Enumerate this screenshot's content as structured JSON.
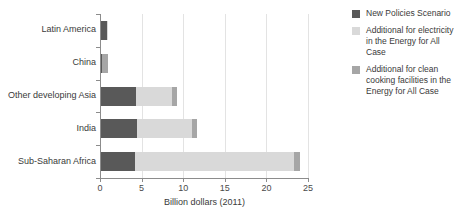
{
  "chart_data": {
    "type": "bar",
    "orientation": "horizontal",
    "stacked": true,
    "title": "",
    "subtitle": "",
    "xlabel": "Billion dollars (2011)",
    "ylabel": "",
    "xlim": [
      0,
      25
    ],
    "xticks": [
      0,
      5,
      10,
      15,
      20,
      25
    ],
    "xticklabels": [
      "0",
      "5",
      "10",
      "15",
      "20",
      "25"
    ],
    "grid": true,
    "grid_axis": "x",
    "legend_position": "right",
    "categories": [
      "Latin America",
      "China",
      "Other developing Asia",
      "India",
      "Sub-Saharan Africa"
    ],
    "series": [
      {
        "name": "New Policies Scenario",
        "color": "#595959",
        "values": [
          0.8,
          0.3,
          4.3,
          4.4,
          4.2
        ]
      },
      {
        "name": "Additional for electricity in the Energy for All Case",
        "color": "#d9d9d9",
        "values": [
          0.05,
          0.0,
          4.4,
          6.6,
          19.1
        ]
      },
      {
        "name": "Additional for clean cooking facilities in the Energy for All Case",
        "color": "#a6a6a6",
        "values": [
          0.0,
          0.7,
          0.6,
          0.7,
          0.7
        ]
      }
    ],
    "totals": [
      0.85,
      1.0,
      9.3,
      11.7,
      24.0
    ]
  },
  "legend": {
    "items": [
      {
        "label": "New Policies Scenario",
        "color": "#595959"
      },
      {
        "label": "Additional for electricity in the Energy for All Case",
        "color": "#d9d9d9"
      },
      {
        "label": "Additional for clean cooking facilities in the Energy for All Case",
        "color": "#a6a6a6"
      }
    ]
  },
  "axis": {
    "x_title": "Billion dollars (2011)",
    "tick_labels": [
      "0",
      "5",
      "10",
      "15",
      "20",
      "25"
    ]
  },
  "colors": {
    "series_1": "#595959",
    "series_2": "#d9d9d9",
    "series_3": "#a6a6a6",
    "axis": "#8c8c8c",
    "grid": "#e3e3e3",
    "text": "#3a3a3a",
    "background": "#ffffff"
  }
}
